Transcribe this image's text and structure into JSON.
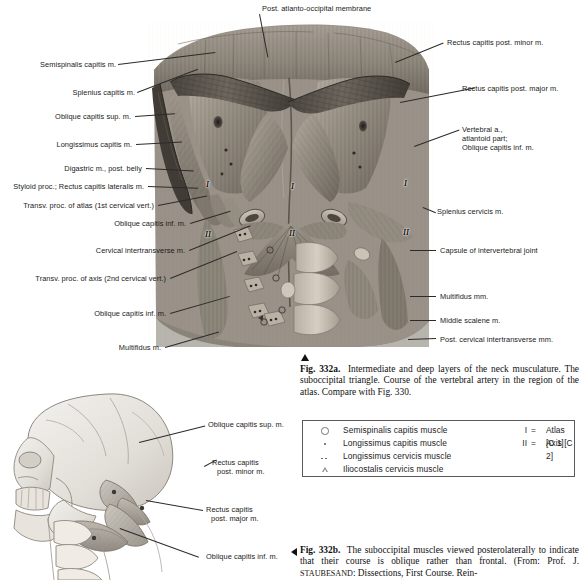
{
  "figure_a": {
    "labels_left": [
      {
        "text": "Semispinalis capitis m.",
        "x": 12,
        "y": 64
      },
      {
        "text": "Splenius capitis m.",
        "x": 39,
        "y": 92
      },
      {
        "text": "Oblique capitis sup. m.",
        "x": 31,
        "y": 116
      },
      {
        "text": "Longissimus capitis m.",
        "x": 37,
        "y": 144
      },
      {
        "text": "Digastric m., post. belly",
        "x": 49,
        "y": 168
      },
      {
        "text": "Styloid proc.; Rectus capitis lateralis m.",
        "x": 4,
        "y": 186
      },
      {
        "text": "Transv. proc. of atlas (1st cervical vert.)",
        "x": 17,
        "y": 205
      },
      {
        "text": "Oblique capitis inf. m.",
        "x": 100,
        "y": 223
      },
      {
        "text": "Cervical intertransverse m.",
        "x": 81,
        "y": 250
      },
      {
        "text": "Transv. proc. of axis (2nd cervical vert.)",
        "x": 26,
        "y": 278
      },
      {
        "text": "Oblique capitis inf. m.",
        "x": 83,
        "y": 313
      },
      {
        "text": "Multifidus m.",
        "x": 117,
        "y": 347
      }
    ],
    "labels_right": [
      {
        "text": "Rectus capitis post. minor m.",
        "x": 447,
        "y": 42
      },
      {
        "text": "Rectus capitis post. major m.",
        "x": 477,
        "y": 88
      },
      {
        "text": "Splenius cervicis m.",
        "x": 437,
        "y": 211
      },
      {
        "text": "Capsule of intervertebral joint",
        "x": 437,
        "y": 249
      },
      {
        "text": "Multifidus mm.",
        "x": 437,
        "y": 295
      },
      {
        "text": "Middle scalene m.",
        "x": 437,
        "y": 319
      },
      {
        "text": "Post. cervical intertransverse mm.",
        "x": 437,
        "y": 338
      }
    ],
    "labels_right_multiline": [
      {
        "lines": [
          "Vertebral a.,",
          "atlantoid part;",
          "Oblique capitis inf. m."
        ],
        "x": 462,
        "y": 129
      }
    ],
    "label_top": {
      "text": "Post. atlanto-occipital membrane",
      "x": 262,
      "y": 8
    },
    "roman_markers": [
      {
        "text": "I",
        "x": 206,
        "y": 182
      },
      {
        "text": "II",
        "x": 206,
        "y": 232
      },
      {
        "text": "I",
        "x": 291,
        "y": 184
      },
      {
        "text": "II",
        "x": 290,
        "y": 231
      },
      {
        "text": "I",
        "x": 404,
        "y": 181
      },
      {
        "text": "II",
        "x": 404,
        "y": 230
      }
    ]
  },
  "caption_a": {
    "fig_no": "Fig. 332a.",
    "text": "Intermediate and deep layers of the neck musculature. The suboccipital triangle. Course of the vertebral artery in the region of the atlas. Compare with Fig. 330."
  },
  "legend": {
    "rows": [
      {
        "symbol": "circle",
        "name": "Semispinalis capitis muscle"
      },
      {
        "symbol": "dot",
        "name": "Longissimus capitis muscle"
      },
      {
        "symbol": "double-dot",
        "name": "Longissimus cervicis muscle"
      },
      {
        "symbol": "triangle",
        "name": "Iliocostalis cervicis muscle"
      }
    ],
    "vertebrae": [
      {
        "numeral": "I",
        "eq": "=",
        "name": "Atlas [C 1]"
      },
      {
        "numeral": "II",
        "eq": "=",
        "name": "Axis [C 2]"
      }
    ]
  },
  "figure_b": {
    "labels": [
      {
        "text": "Oblique capitis sup. m.",
        "x": 206,
        "y": 424
      },
      {
        "lines": [
          "Rectus capitis",
          "post. minor m."
        ],
        "x": 219,
        "y": 462
      },
      {
        "lines": [
          "Rectus capitis",
          "post. major m."
        ],
        "x": 206,
        "y": 509
      },
      {
        "text": "Oblique capitis inf. m.",
        "x": 206,
        "y": 556
      }
    ]
  },
  "caption_b": {
    "fig_no": "Fig. 332b.",
    "text_1": "The suboccipital muscles viewed posterolaterally to indicate that their course is oblique rather than frontal. (From: Prof. J. ",
    "smallcaps": "Staubesand",
    "text_2": ": Dissections, First Course. Rein-"
  },
  "colors": {
    "ink": "#141414",
    "leader": "#2b2b2b",
    "legend_border": "#5a5a5a",
    "photo_dark": "#5d5954",
    "photo_mid": "#8e8880",
    "photo_light": "#bfb8ae"
  }
}
